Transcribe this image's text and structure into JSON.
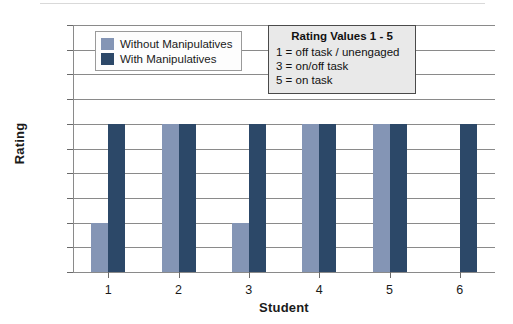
{
  "chart_data": {
    "type": "bar",
    "title": "",
    "xlabel": "Student",
    "ylabel": "Rating",
    "categories": [
      "1",
      "2",
      "3",
      "4",
      "5",
      "6"
    ],
    "series": [
      {
        "name": "Without Manipulatives",
        "color": "#8495b5",
        "values": [
          1,
          3,
          1,
          3,
          3,
          0
        ]
      },
      {
        "name": "With Manipulatives",
        "color": "#2c4868",
        "values": [
          3,
          3,
          3,
          3,
          3,
          3
        ]
      }
    ],
    "ylim": [
      0,
      5
    ],
    "ytick_labels": [
      "5.0",
      "4.5",
      "4.0",
      "3.5",
      "3.0",
      "2.5",
      "2.0",
      "1.5",
      "1.0",
      "0.5",
      "0"
    ],
    "ytick_values": [
      5,
      4.5,
      4,
      3.5,
      3,
      2.5,
      2,
      1.5,
      1,
      0.5,
      0
    ],
    "grid": true,
    "legend_position": "upper-left-inside"
  },
  "legend": {
    "entries": [
      {
        "label": "Without Manipulatives",
        "color": "#8495b5"
      },
      {
        "label": "With Manipulatives",
        "color": "#2c4868"
      }
    ]
  },
  "annotation": {
    "title": "Rating Values 1 - 5",
    "lines": [
      "1 = off task / unengaged",
      "3 = on/off task",
      "5 = on task"
    ]
  }
}
